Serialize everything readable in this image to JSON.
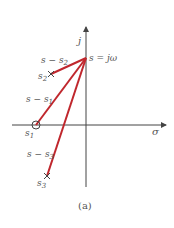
{
  "figure": {
    "caption": "(a)",
    "axes": {
      "imag_label": "j",
      "real_label": "σ"
    },
    "point": {
      "label": "s = jω"
    },
    "poles_zeros": [
      {
        "id": "s1",
        "type": "zero",
        "label": "s",
        "sub": "1"
      },
      {
        "id": "s2",
        "type": "pole",
        "label": "s",
        "sub": "2"
      },
      {
        "id": "s3",
        "type": "pole",
        "label": "s",
        "sub": "3"
      }
    ],
    "vectors": [
      {
        "label": "s − s",
        "sub": "1"
      },
      {
        "label": "s − s",
        "sub": "2"
      },
      {
        "label": "s − s",
        "sub": "3"
      }
    ],
    "colors": {
      "vector": "#c0272d",
      "axis": "#444444",
      "text": "#555555"
    }
  }
}
